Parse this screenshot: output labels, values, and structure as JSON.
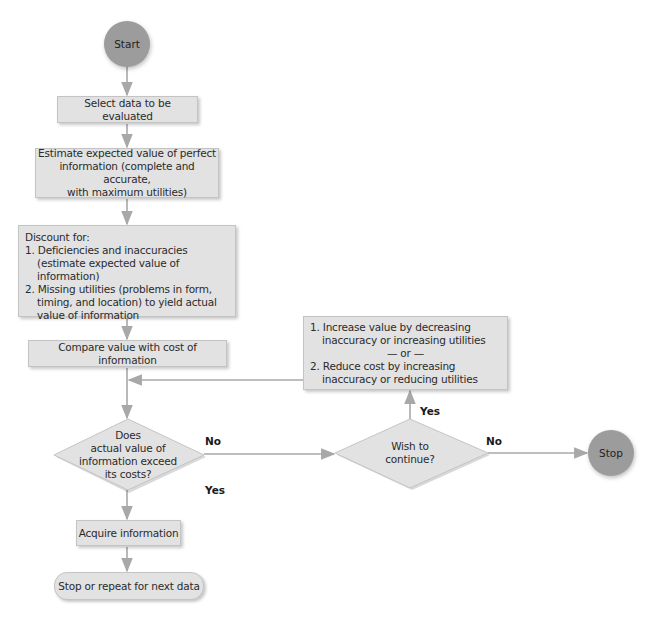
{
  "diagram": {
    "type": "flowchart",
    "colors": {
      "box_fill": "#e2e2e2",
      "box_border": "#c4c4c4",
      "terminal_fill": "#9c9c9c",
      "arrow": "#a8a8a8",
      "text": "#2b2b2b"
    },
    "nodes": {
      "start": {
        "label": "Start"
      },
      "select": {
        "label": "Select data to be evaluated"
      },
      "estimate": {
        "label": "Estimate expected value of perfect information (complete and accurate, with maximum utilities)",
        "lines": [
          "Estimate expected value of perfect",
          "information (complete and accurate,",
          "with maximum utilities)"
        ]
      },
      "discount": {
        "heading": "Discount for:",
        "items": [
          "1. Deficiencies and inaccuracies (estimate expected value of information)",
          "2. Missing utilities (problems in form, timing, and location) to yield actual value of information"
        ]
      },
      "compare": {
        "label": "Compare value with cost of information"
      },
      "decision_value": {
        "lines": [
          "Does",
          "actual value of",
          "information exceed",
          "its costs?"
        ]
      },
      "adjust": {
        "items": [
          "1. Increase value by decreasing inaccuracy or increasing utilities",
          "2. Reduce cost by increasing inaccuracy or reducing utilities"
        ],
        "separator": "— or —"
      },
      "decision_continue": {
        "lines": [
          "Wish to",
          "continue?"
        ]
      },
      "stop": {
        "label": "Stop"
      },
      "acquire": {
        "label": "Acquire information"
      },
      "stop_or_repeat": {
        "label": "Stop or repeat for next data"
      }
    },
    "edge_labels": {
      "value_no": "No",
      "value_yes": "Yes",
      "continue_yes": "Yes",
      "continue_no": "No"
    }
  }
}
